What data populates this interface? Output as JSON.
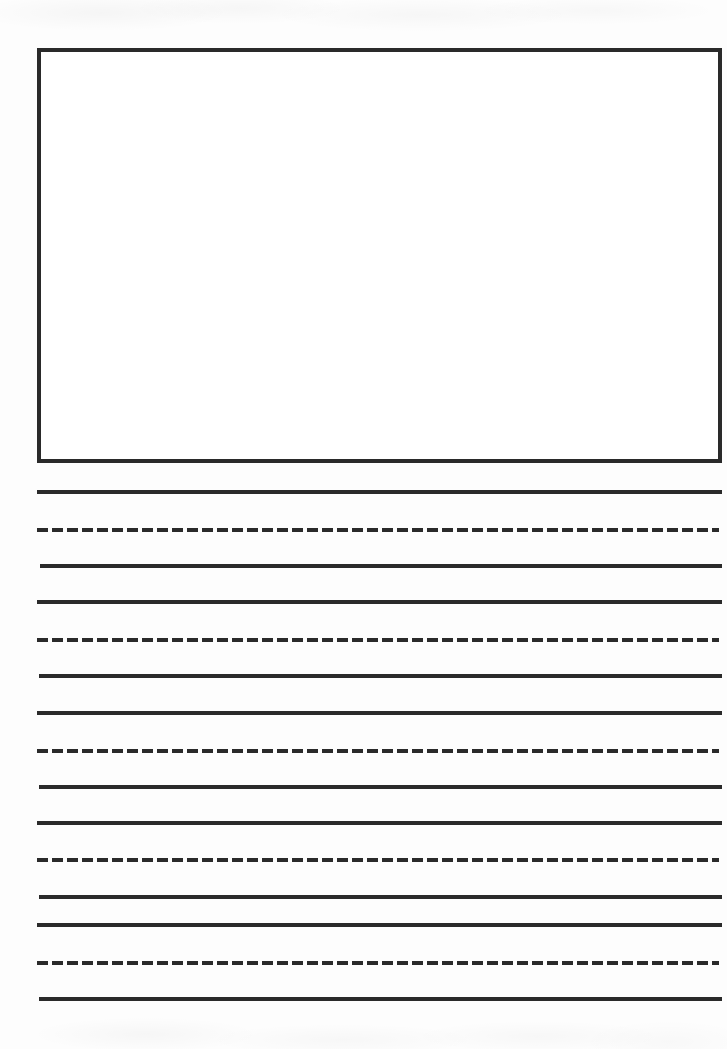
{
  "document": {
    "type": "handwriting-practice-worksheet",
    "title": "Primary Writing Paper",
    "page_width": 727,
    "page_height": 1049,
    "background_color": "#fdfdfd",
    "ink_color": "#2a2a2a"
  },
  "drawing_box": {
    "label": "Drawing area",
    "x": 37,
    "y": 48,
    "width": 685,
    "height": 415,
    "border_width": 4,
    "border_color": "#2a2a2a",
    "fill_color": "#ffffff",
    "content": ""
  },
  "ruling": {
    "left": 37,
    "right": 722,
    "solid_thickness": 4,
    "dashed_thickness": 4,
    "dash_length": 11,
    "dash_gap": 4,
    "line_color": "#2a2a2a",
    "lines": [
      {
        "index": 1,
        "style": "solid",
        "role": "baseline",
        "y": 490,
        "left": 37,
        "right": 722,
        "thickness": 4
      },
      {
        "index": 2,
        "style": "dashed",
        "role": "midline",
        "y": 528,
        "left": 37,
        "right": 719,
        "thickness": 4
      },
      {
        "index": 3,
        "style": "solid",
        "role": "baseline",
        "y": 564,
        "left": 40,
        "right": 722,
        "thickness": 4
      },
      {
        "index": 4,
        "style": "solid",
        "role": "topline",
        "y": 600,
        "left": 37,
        "right": 722,
        "thickness": 4
      },
      {
        "index": 5,
        "style": "dashed",
        "role": "midline",
        "y": 638,
        "left": 37,
        "right": 719,
        "thickness": 4
      },
      {
        "index": 6,
        "style": "solid",
        "role": "baseline",
        "y": 674,
        "left": 39,
        "right": 722,
        "thickness": 4
      },
      {
        "index": 7,
        "style": "solid",
        "role": "topline",
        "y": 711,
        "left": 37,
        "right": 722,
        "thickness": 4
      },
      {
        "index": 8,
        "style": "dashed",
        "role": "midline",
        "y": 749,
        "left": 37,
        "right": 719,
        "thickness": 4
      },
      {
        "index": 9,
        "style": "solid",
        "role": "baseline",
        "y": 785,
        "left": 39,
        "right": 722,
        "thickness": 4
      },
      {
        "index": 10,
        "style": "solid",
        "role": "topline",
        "y": 821,
        "left": 37,
        "right": 722,
        "thickness": 4
      },
      {
        "index": 11,
        "style": "dashed",
        "role": "midline",
        "y": 858,
        "left": 37,
        "right": 719,
        "thickness": 4
      },
      {
        "index": 12,
        "style": "solid",
        "role": "baseline",
        "y": 895,
        "left": 39,
        "right": 722,
        "thickness": 4
      },
      {
        "index": 13,
        "style": "solid",
        "role": "topline",
        "y": 923,
        "left": 37,
        "right": 722,
        "thickness": 4
      },
      {
        "index": 14,
        "style": "dashed",
        "role": "midline",
        "y": 961,
        "left": 37,
        "right": 719,
        "thickness": 4
      },
      {
        "index": 15,
        "style": "solid",
        "role": "baseline",
        "y": 997,
        "left": 39,
        "right": 722,
        "thickness": 4
      }
    ]
  },
  "writing_content": {
    "drawing_box_text": "",
    "line_text": [
      "",
      "",
      "",
      "",
      "",
      "",
      "",
      "",
      "",
      "",
      "",
      "",
      "",
      "",
      ""
    ]
  }
}
